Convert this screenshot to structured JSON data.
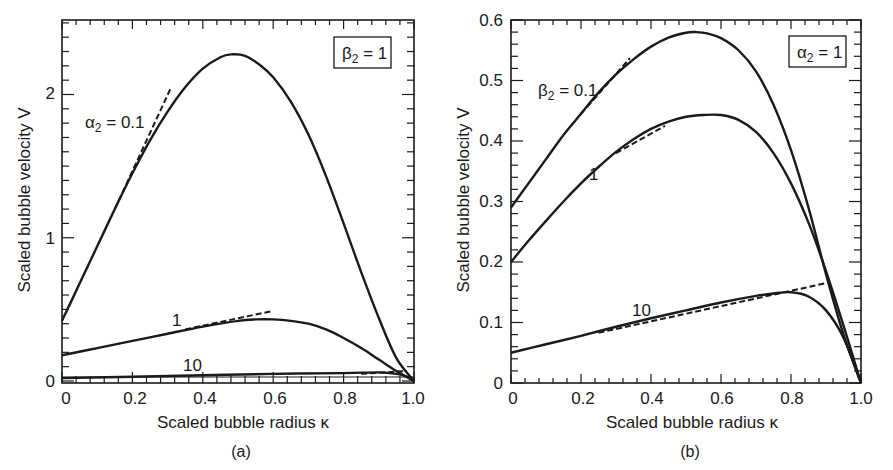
{
  "chart_data": [
    {
      "panel": "(a)",
      "type": "line",
      "caption": "(a)",
      "xlabel": "Scaled bubble radius κ",
      "ylabel": "Scaled bubble velocity V",
      "xlim": [
        0,
        1.0
      ],
      "ylim": [
        0,
        2.5
      ],
      "xticks": [
        "0",
        "0.2",
        "0.4",
        "0.6",
        "0.8",
        "1.0"
      ],
      "yticks": [
        "0",
        "1",
        "2"
      ],
      "grid": false,
      "fixed_parameter": {
        "label_main": "β",
        "label_sub": "2",
        "label_rest": " = 1"
      },
      "series": [
        {
          "name": "α2 = 0.1",
          "label_main": "α",
          "label_sub": "2",
          "label_rest": " = 0.1",
          "style": "solid",
          "x": [
            0,
            0.05,
            0.1,
            0.15,
            0.2,
            0.25,
            0.3,
            0.35,
            0.4,
            0.45,
            0.48,
            0.52,
            0.56,
            0.6,
            0.65,
            0.7,
            0.75,
            0.8,
            0.85,
            0.9,
            0.95,
            1.0
          ],
          "y": [
            0.42,
            0.68,
            0.94,
            1.2,
            1.45,
            1.68,
            1.88,
            2.05,
            2.18,
            2.26,
            2.28,
            2.27,
            2.21,
            2.12,
            1.95,
            1.72,
            1.43,
            1.1,
            0.76,
            0.44,
            0.16,
            0.0
          ]
        },
        {
          "name": "α2 = 0.1 asymptote",
          "style": "dashed",
          "x": [
            0.15,
            0.31
          ],
          "y": [
            1.2,
            2.05
          ]
        },
        {
          "name": "α2 = 1",
          "label_main": "1",
          "label_sub": "",
          "label_rest": "",
          "style": "solid",
          "x": [
            0,
            0.1,
            0.2,
            0.3,
            0.4,
            0.5,
            0.55,
            0.6,
            0.65,
            0.7,
            0.75,
            0.8,
            0.85,
            0.9,
            0.95,
            1.0
          ],
          "y": [
            0.18,
            0.23,
            0.28,
            0.33,
            0.38,
            0.42,
            0.43,
            0.43,
            0.42,
            0.4,
            0.36,
            0.3,
            0.23,
            0.15,
            0.07,
            0.0
          ]
        },
        {
          "name": "α2 = 1 asymptote",
          "style": "dashed",
          "x": [
            0.35,
            0.6
          ],
          "y": [
            0.36,
            0.49
          ]
        },
        {
          "name": "α2 = 10",
          "label_main": "10",
          "label_sub": "",
          "label_rest": "",
          "style": "solid",
          "x": [
            0,
            0.2,
            0.4,
            0.6,
            0.8,
            0.9,
            0.95,
            0.98,
            1.0
          ],
          "y": [
            0.02,
            0.03,
            0.04,
            0.05,
            0.055,
            0.06,
            0.05,
            0.03,
            0.0
          ]
        },
        {
          "name": "α2 = 10 asymptote",
          "style": "dashed",
          "x": [
            0.85,
            0.98
          ],
          "y": [
            0.05,
            0.07
          ]
        }
      ]
    },
    {
      "panel": "(b)",
      "type": "line",
      "caption": "(b)",
      "xlabel": "Scaled bubble radius κ",
      "ylabel": "Scaled bubble velocity V",
      "xlim": [
        0,
        1.0
      ],
      "ylim": [
        0,
        0.6
      ],
      "xticks": [
        "0",
        "0.2",
        "0.4",
        "0.6",
        "0.8",
        "1.0"
      ],
      "yticks": [
        "0",
        "0.1",
        "0.2",
        "0.3",
        "0.4",
        "0.5",
        "0.6"
      ],
      "grid": false,
      "fixed_parameter": {
        "label_main": "α",
        "label_sub": "2",
        "label_rest": " = 1"
      },
      "series": [
        {
          "name": "β2 = 0.1",
          "label_main": "β",
          "label_sub": "2",
          "label_rest": " = 0.1",
          "style": "solid",
          "x": [
            0,
            0.05,
            0.1,
            0.15,
            0.2,
            0.25,
            0.3,
            0.35,
            0.4,
            0.45,
            0.5,
            0.53,
            0.56,
            0.6,
            0.65,
            0.7,
            0.75,
            0.8,
            0.85,
            0.9,
            0.95,
            1.0
          ],
          "y": [
            0.29,
            0.33,
            0.37,
            0.41,
            0.445,
            0.48,
            0.51,
            0.535,
            0.556,
            0.571,
            0.579,
            0.58,
            0.578,
            0.57,
            0.55,
            0.515,
            0.46,
            0.385,
            0.29,
            0.18,
            0.08,
            0.0
          ]
        },
        {
          "name": "β2 = 0.1 asymptote",
          "style": "dashed",
          "x": [
            0.2,
            0.34
          ],
          "y": [
            0.445,
            0.537
          ]
        },
        {
          "name": "β2 = 1",
          "label_main": "1",
          "label_sub": "",
          "label_rest": "",
          "style": "solid",
          "x": [
            0,
            0.05,
            0.1,
            0.15,
            0.2,
            0.25,
            0.3,
            0.35,
            0.4,
            0.45,
            0.5,
            0.55,
            0.6,
            0.65,
            0.7,
            0.75,
            0.8,
            0.85,
            0.9,
            0.95,
            1.0
          ],
          "y": [
            0.2,
            0.235,
            0.268,
            0.3,
            0.33,
            0.357,
            0.382,
            0.403,
            0.42,
            0.432,
            0.44,
            0.443,
            0.443,
            0.435,
            0.415,
            0.38,
            0.33,
            0.265,
            0.185,
            0.095,
            0.0
          ]
        },
        {
          "name": "β2 = 1 asymptote",
          "style": "dashed",
          "x": [
            0.3,
            0.44
          ],
          "y": [
            0.38,
            0.425
          ]
        },
        {
          "name": "β2 = 10",
          "label_main": "10",
          "label_sub": "",
          "label_rest": "",
          "style": "solid",
          "x": [
            0,
            0.1,
            0.2,
            0.3,
            0.4,
            0.5,
            0.6,
            0.7,
            0.75,
            0.8,
            0.85,
            0.9,
            0.95,
            1.0
          ],
          "y": [
            0.05,
            0.064,
            0.078,
            0.093,
            0.107,
            0.12,
            0.133,
            0.144,
            0.148,
            0.15,
            0.143,
            0.12,
            0.075,
            0.0
          ]
        },
        {
          "name": "β2 = 10 asymptote",
          "style": "dashed",
          "x": [
            0.25,
            0.9
          ],
          "y": [
            0.083,
            0.165
          ]
        }
      ]
    }
  ],
  "labels": {
    "panel_a": {
      "ylabel": "Scaled bubble velocity V",
      "xlabel": "Scaled bubble radius κ",
      "caption": "(a)",
      "box_main": "β",
      "box_sub": "2",
      "box_rest": " = 1",
      "curve1_main": "α",
      "curve1_sub": "2",
      "curve1_rest": " = 0.1",
      "curve2": "1",
      "curve3": "10",
      "xticks": [
        "0",
        "0.2",
        "0.4",
        "0.6",
        "0.8",
        "1.0"
      ],
      "yticks": [
        "0",
        "1",
        "2"
      ]
    },
    "panel_b": {
      "ylabel": "Scaled bubble velocity V",
      "xlabel": "Scaled bubble radius κ",
      "caption": "(b)",
      "box_main": "α",
      "box_sub": "2",
      "box_rest": " = 1",
      "curve1_main": "β",
      "curve1_sub": "2",
      "curve1_rest": " = 0.1",
      "curve2": "1",
      "curve3": "10",
      "xticks": [
        "0",
        "0.2",
        "0.4",
        "0.6",
        "0.8",
        "1.0"
      ],
      "yticks": [
        "0",
        "0.1",
        "0.2",
        "0.3",
        "0.4",
        "0.5",
        "0.6"
      ]
    }
  }
}
